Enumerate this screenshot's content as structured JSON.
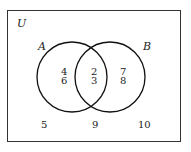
{
  "diagram": {
    "type": "venn",
    "universe_label": "U",
    "sets": [
      {
        "label": "A",
        "only_elements": [
          "4",
          "6"
        ]
      },
      {
        "label": "B",
        "only_elements": [
          "7",
          "8"
        ]
      }
    ],
    "intersection_elements": [
      "2",
      "3"
    ],
    "outside_elements": [
      "5",
      "9",
      "10"
    ]
  }
}
